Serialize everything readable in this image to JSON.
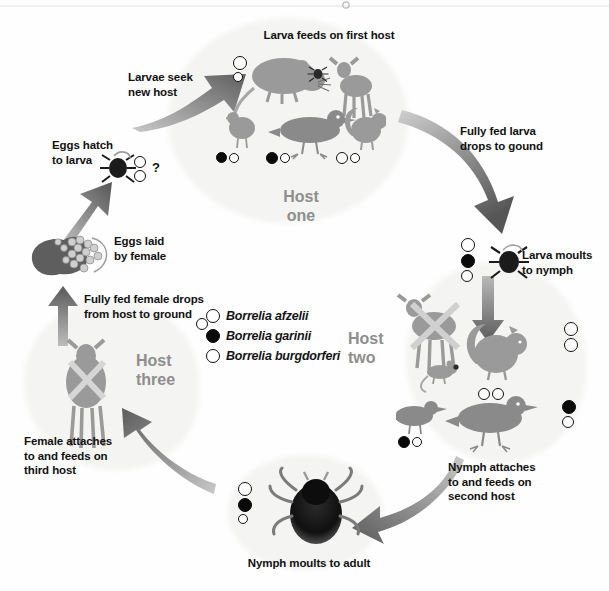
{
  "diagram": {
    "host_labels": [
      {
        "id": "host-one",
        "text": "Host\none"
      },
      {
        "id": "host-two",
        "text": "Host\ntwo"
      },
      {
        "id": "host-three",
        "text": "Host\nthree"
      }
    ],
    "stage_labels": [
      {
        "id": "larva-feeds",
        "text": "Larva feeds on first host"
      },
      {
        "id": "larvae-seek",
        "text": "Larvae seek\nnew host"
      },
      {
        "id": "eggs-hatch",
        "text": "Eggs hatch\nto larva"
      },
      {
        "id": "eggs-laid",
        "text": "Eggs laid\nby female"
      },
      {
        "id": "fully-fed-female",
        "text": "Fully fed female drops\nfrom host to ground"
      },
      {
        "id": "female-attaches",
        "text": "Female attaches\nto and feeds on\nthird host"
      },
      {
        "id": "nymph-moults",
        "text": "Nymph moults to adult"
      },
      {
        "id": "nymph-attaches",
        "text": "Nymph attaches\nto and feeds on\nsecond host"
      },
      {
        "id": "larva-moults",
        "text": "Larva moults\nto nymph"
      },
      {
        "id": "fully-fed-larva",
        "text": "Fully fed larva\ndrops to gound"
      }
    ],
    "unknown_marker": "?",
    "legend": {
      "items": [
        {
          "label": "Borrelia afzelii",
          "marker": "open-circle"
        },
        {
          "label": "Borrelia garinii",
          "marker": "filled-circle"
        },
        {
          "label": "Borrelia burgdorferi",
          "marker": "open-circle"
        }
      ]
    },
    "colors": {
      "text": "#111111",
      "host_label": "#8e8e8e",
      "arrow": "#6f6f6f",
      "blob": "#f4f4f2",
      "marker_fill": "#0a0a0a",
      "marker_open": "#ffffff",
      "background": "#fefefe"
    },
    "animals": {
      "host_one": [
        "mouse",
        "deer",
        "bird",
        "bird",
        "squirrel"
      ],
      "host_two": [
        "deer-crossed-out",
        "squirrel",
        "mouse",
        "bird",
        "bird"
      ],
      "host_three": [
        "deer"
      ]
    },
    "ticks": [
      "larva",
      "nymph",
      "adult-female",
      "adult-engorged"
    ]
  }
}
